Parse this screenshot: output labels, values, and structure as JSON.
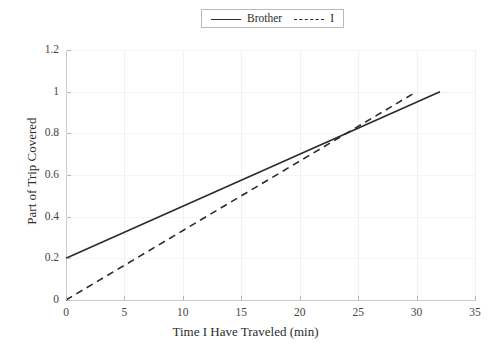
{
  "chart_data": {
    "type": "line",
    "title": "",
    "xlabel": "Time I Have Traveled (min)",
    "ylabel": "Part of Trip Covered",
    "xlim": [
      0,
      35
    ],
    "ylim": [
      0,
      1.2
    ],
    "xticks": [
      0,
      5,
      10,
      15,
      20,
      25,
      30,
      35
    ],
    "xtick_labels": [
      "0",
      "5",
      "10",
      "15",
      "20",
      "25",
      "30",
      "35"
    ],
    "yticks": [
      0,
      0.2,
      0.4,
      0.6,
      0.8,
      1.0,
      1.2
    ],
    "ytick_labels": [
      "0",
      "0.2",
      "0.4",
      "0.6",
      "0.8",
      "1",
      "1.2"
    ],
    "grid": true,
    "legend_position": "top-center",
    "series": [
      {
        "name": "Brother",
        "style": "solid",
        "color": "#2b2b2b",
        "x": [
          0,
          32
        ],
        "values": [
          0.2,
          1.0
        ],
        "intercept": 0.2,
        "slope": 0.025
      },
      {
        "name": "I",
        "style": "dashed",
        "color": "#2b2b2b",
        "x": [
          0,
          30
        ],
        "values": [
          0.0,
          1.0
        ],
        "intercept": 0.0,
        "slope": 0.0333
      }
    ],
    "annotations": [
      {
        "label": "intersection",
        "x": 24,
        "y": 0.8
      }
    ]
  },
  "legend": {
    "entries": [
      {
        "label": "Brother"
      },
      {
        "label": "I"
      }
    ]
  }
}
